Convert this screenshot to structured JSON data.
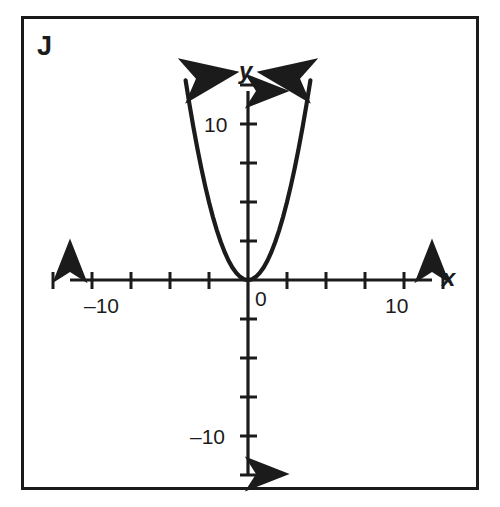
{
  "panel": {
    "label": "J"
  },
  "chart_data": {
    "type": "line",
    "title": "",
    "subtitle": "",
    "xlabel": "x",
    "ylabel": "y",
    "xlim": [
      -11.8,
      11.8
    ],
    "ylim": [
      -11.8,
      11.8
    ],
    "grid": false,
    "legend": null,
    "axis_style": "cartesian-arrows",
    "x_ticks": [
      -10,
      -8,
      -6,
      -4,
      -2,
      2,
      4,
      6,
      8,
      10
    ],
    "y_ticks": [
      -10,
      -8,
      -6,
      -4,
      -2,
      2,
      4,
      6,
      8,
      10
    ],
    "x_tick_labels": [
      {
        "value": -10,
        "text": "–10"
      },
      {
        "value": 10,
        "text": "10"
      }
    ],
    "y_tick_labels": [
      {
        "value": 10,
        "text": "10"
      },
      {
        "value": -10,
        "text": "–10"
      }
    ],
    "origin_label": "0",
    "series": [
      {
        "name": "parabola",
        "equation": "y = x^2",
        "color": "#1b1b1b",
        "arrow_ends": "both",
        "x": [
          -3.2,
          -3.0,
          -2.8,
          -2.6,
          -2.4,
          -2.2,
          -2.0,
          -1.8,
          -1.6,
          -1.4,
          -1.2,
          -1.0,
          -0.8,
          -0.6,
          -0.4,
          -0.2,
          0.0,
          0.2,
          0.4,
          0.6,
          0.8,
          1.0,
          1.2,
          1.4,
          1.6,
          1.8,
          2.0,
          2.2,
          2.4,
          2.6,
          2.8,
          3.0,
          3.2
        ],
        "values": [
          10.24,
          9.0,
          7.84,
          6.76,
          5.76,
          4.84,
          4.0,
          3.24,
          2.56,
          1.96,
          1.44,
          1.0,
          0.64,
          0.36,
          0.16,
          0.04,
          0.0,
          0.04,
          0.16,
          0.36,
          0.64,
          1.0,
          1.44,
          1.96,
          2.56,
          3.24,
          4.0,
          4.84,
          5.76,
          6.76,
          7.84,
          9.0,
          10.24
        ]
      }
    ]
  }
}
